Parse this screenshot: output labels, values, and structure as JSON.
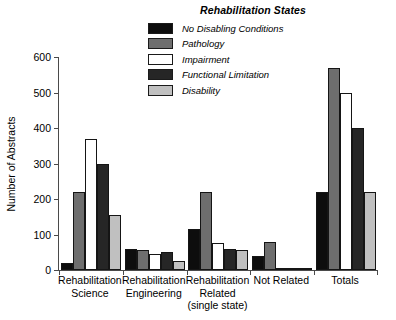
{
  "chart_data": {
    "type": "bar",
    "title": "Rehabilitation States",
    "xlabel": "",
    "ylabel": "Number of Abstracts",
    "ylim": [
      0,
      600
    ],
    "yticks": [
      0,
      100,
      200,
      300,
      400,
      500,
      600
    ],
    "grid": false,
    "legend_position": "top-center",
    "categories": [
      "Rehabilitation Science",
      "Rehabilitation Engineering",
      "Rehabilitation Related (single state)",
      "Not Related",
      "Totals"
    ],
    "category_lines": [
      [
        "Rehabilitation",
        "Science"
      ],
      [
        "Rehabilitation",
        "Engineering"
      ],
      [
        "Rehabilitation",
        "Related",
        "(single state)"
      ],
      [
        "Not Related"
      ],
      [
        "Totals"
      ]
    ],
    "series": [
      {
        "name": "No Disabling Conditions",
        "color": "#0d0d0d",
        "values": [
          20,
          60,
          115,
          40,
          220
        ]
      },
      {
        "name": "Pathology",
        "color": "#6e6e6e",
        "values": [
          220,
          55,
          220,
          80,
          570
        ]
      },
      {
        "name": "Impairment",
        "color": "#ffffff",
        "values": [
          370,
          45,
          75,
          2,
          500
        ]
      },
      {
        "name": "Functional Limitation",
        "color": "#262626",
        "values": [
          300,
          50,
          60,
          5,
          400
        ]
      },
      {
        "name": "Disability",
        "color": "#c0c0c0",
        "values": [
          155,
          25,
          55,
          0,
          220
        ]
      }
    ]
  },
  "legend": {
    "title": "Rehabilitation States",
    "items": [
      {
        "label": "No Disabling Conditions",
        "swatch": "#0d0d0d"
      },
      {
        "label": "Pathology",
        "swatch": "#6e6e6e"
      },
      {
        "label": "Impairment",
        "swatch": "#ffffff"
      },
      {
        "label": "Functional Limitation",
        "swatch": "#262626"
      },
      {
        "label": "Disability",
        "swatch": "#c0c0c0"
      }
    ]
  },
  "axes": {
    "y_title": "Number of Abstracts",
    "y_ticks": [
      "600",
      "500",
      "400",
      "300",
      "200",
      "100",
      "0"
    ]
  }
}
